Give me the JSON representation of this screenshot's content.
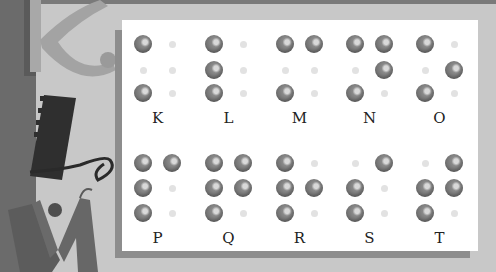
{
  "colors": {
    "background": "#c8c8c8",
    "left_strip": "#6b6b6b",
    "panel": "#ffffff",
    "panel_shadow": "#8d8d8d",
    "raised_dot": "#7a7a7a",
    "flat_dot": "#e2e2e2",
    "label_text": "#222222"
  },
  "decorative_letters": [
    "K",
    "L",
    "M"
  ],
  "braille_rows": [
    {
      "row": 1,
      "cells": [
        {
          "letter": "K",
          "dots": [
            1,
            3
          ]
        },
        {
          "letter": "L",
          "dots": [
            1,
            2,
            3
          ]
        },
        {
          "letter": "M",
          "dots": [
            1,
            3,
            4
          ]
        },
        {
          "letter": "N",
          "dots": [
            1,
            3,
            4,
            5
          ]
        },
        {
          "letter": "O",
          "dots": [
            1,
            3,
            5
          ]
        }
      ]
    },
    {
      "row": 2,
      "cells": [
        {
          "letter": "P",
          "dots": [
            1,
            2,
            3,
            4
          ]
        },
        {
          "letter": "Q",
          "dots": [
            1,
            2,
            3,
            4,
            5
          ]
        },
        {
          "letter": "R",
          "dots": [
            1,
            2,
            3,
            5
          ]
        },
        {
          "letter": "S",
          "dots": [
            2,
            3,
            4
          ]
        },
        {
          "letter": "T",
          "dots": [
            2,
            3,
            4,
            5
          ]
        }
      ]
    }
  ]
}
